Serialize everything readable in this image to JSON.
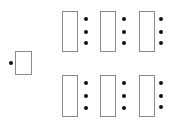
{
  "diagram": {
    "colors": {
      "background": "#ffffff",
      "box_border": "#8a8a8a",
      "dot": "#111111"
    },
    "source_block": {
      "box": {
        "x": 15,
        "y": 51,
        "w": 17,
        "h": 24
      },
      "dots": [
        {
          "x": 11,
          "y": 63
        }
      ]
    },
    "target_blocks": [
      {
        "row": 1,
        "col": 1,
        "box": {
          "x": 62,
          "y": 11,
          "w": 16,
          "h": 41
        },
        "dots": [
          {
            "x": 86,
            "y": 19
          },
          {
            "x": 86,
            "y": 32
          },
          {
            "x": 86,
            "y": 43
          }
        ]
      },
      {
        "row": 1,
        "col": 2,
        "box": {
          "x": 100,
          "y": 11,
          "w": 16,
          "h": 41
        },
        "dots": [
          {
            "x": 124,
            "y": 19
          },
          {
            "x": 124,
            "y": 32
          },
          {
            "x": 124,
            "y": 43
          }
        ]
      },
      {
        "row": 1,
        "col": 3,
        "box": {
          "x": 139,
          "y": 11,
          "w": 16,
          "h": 41
        },
        "dots": [
          {
            "x": 161,
            "y": 19
          },
          {
            "x": 161,
            "y": 32
          },
          {
            "x": 161,
            "y": 43
          }
        ]
      },
      {
        "row": 2,
        "col": 1,
        "box": {
          "x": 62,
          "y": 75,
          "w": 16,
          "h": 42
        },
        "dots": [
          {
            "x": 86,
            "y": 83
          },
          {
            "x": 86,
            "y": 96
          },
          {
            "x": 86,
            "y": 108
          }
        ]
      },
      {
        "row": 2,
        "col": 2,
        "box": {
          "x": 100,
          "y": 75,
          "w": 16,
          "h": 42
        },
        "dots": [
          {
            "x": 124,
            "y": 83
          },
          {
            "x": 124,
            "y": 96
          },
          {
            "x": 124,
            "y": 108
          }
        ]
      },
      {
        "row": 2,
        "col": 3,
        "box": {
          "x": 139,
          "y": 75,
          "w": 16,
          "h": 42
        },
        "dots": [
          {
            "x": 161,
            "y": 83
          },
          {
            "x": 161,
            "y": 96
          },
          {
            "x": 161,
            "y": 107
          }
        ]
      }
    ]
  }
}
